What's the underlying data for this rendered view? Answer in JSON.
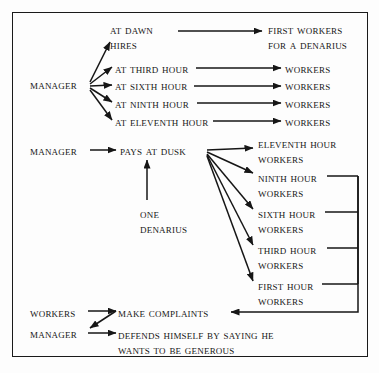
{
  "diagram": {
    "border_color": "#1a1a1a",
    "text_color": "#161616",
    "background": "#fdfdfd",
    "nodes": [
      {
        "id": "at-dawn-hires",
        "line1": "At Dawn",
        "line2": "Hires",
        "x": 110,
        "y": 22
      },
      {
        "id": "first-workers",
        "line1": "First Workers",
        "line2": "For a Denarius",
        "x": 268,
        "y": 22
      },
      {
        "id": "manager-hires",
        "line1": "Manager",
        "line2": "",
        "x": 30,
        "y": 78
      },
      {
        "id": "at-third-hour",
        "line1": "At Third Hour",
        "line2": "",
        "x": 115,
        "y": 62
      },
      {
        "id": "at-sixth-hour",
        "line1": "At Sixth Hour",
        "line2": "",
        "x": 115,
        "y": 79
      },
      {
        "id": "at-ninth-hour",
        "line1": "At Ninth Hour",
        "line2": "",
        "x": 115,
        "y": 97
      },
      {
        "id": "at-eleventh-hour",
        "line1": "At Eleventh Hour",
        "line2": "",
        "x": 115,
        "y": 115
      },
      {
        "id": "workers-third",
        "line1": "Workers",
        "line2": "",
        "x": 285,
        "y": 62
      },
      {
        "id": "workers-sixth",
        "line1": "Workers",
        "line2": "",
        "x": 285,
        "y": 79
      },
      {
        "id": "workers-ninth",
        "line1": "Workers",
        "line2": "",
        "x": 285,
        "y": 97
      },
      {
        "id": "workers-eleventh",
        "line1": "Workers",
        "line2": "",
        "x": 285,
        "y": 115
      },
      {
        "id": "manager-pays",
        "line1": "Manager",
        "line2": "",
        "x": 30,
        "y": 144
      },
      {
        "id": "pays-at-dusk",
        "line1": "Pays At Dusk",
        "line2": "",
        "x": 120,
        "y": 144
      },
      {
        "id": "one-denarius",
        "line1": "One",
        "line2": "Denarius",
        "x": 140,
        "y": 206
      },
      {
        "id": "eleventh-hour-workers",
        "line1": "Eleventh Hour",
        "line2": "Workers",
        "x": 258,
        "y": 136
      },
      {
        "id": "ninth-hour-workers",
        "line1": "Ninth Hour",
        "line2": "Workers",
        "x": 258,
        "y": 170
      },
      {
        "id": "sixth-hour-workers",
        "line1": "Sixth Hour",
        "line2": "Workers",
        "x": 258,
        "y": 206
      },
      {
        "id": "third-hour-workers",
        "line1": "Third Hour",
        "line2": "Workers",
        "x": 258,
        "y": 242
      },
      {
        "id": "first-hour-workers",
        "line1": "First Hour",
        "line2": "Workers",
        "x": 258,
        "y": 278
      },
      {
        "id": "workers-complain",
        "line1": "Workers",
        "line2": "",
        "x": 30,
        "y": 306
      },
      {
        "id": "make-complaints",
        "line1": "Make complaints",
        "line2": "",
        "x": 118,
        "y": 306
      },
      {
        "id": "manager-defends",
        "line1": "Manager",
        "line2": "",
        "x": 30,
        "y": 327
      },
      {
        "id": "defends-himself",
        "line1": "Defends Himself By Saying He",
        "line2": "Wants To Be Generous",
        "x": 118,
        "y": 327
      }
    ],
    "edges": [
      {
        "id": "edge-dawn-to-first-workers",
        "from": "at-dawn-hires",
        "to": "first-workers"
      },
      {
        "id": "edge-manager-to-dawn",
        "from": "manager-hires",
        "to": "at-dawn-hires"
      },
      {
        "id": "edge-manager-to-third",
        "from": "manager-hires",
        "to": "at-third-hour"
      },
      {
        "id": "edge-manager-to-sixth",
        "from": "manager-hires",
        "to": "at-sixth-hour"
      },
      {
        "id": "edge-manager-to-ninth",
        "from": "manager-hires",
        "to": "at-ninth-hour"
      },
      {
        "id": "edge-manager-to-eleventh",
        "from": "manager-hires",
        "to": "at-eleventh-hour"
      },
      {
        "id": "edge-third-to-workers",
        "from": "at-third-hour",
        "to": "workers-third"
      },
      {
        "id": "edge-sixth-to-workers",
        "from": "at-sixth-hour",
        "to": "workers-sixth"
      },
      {
        "id": "edge-ninth-to-workers",
        "from": "at-ninth-hour",
        "to": "workers-ninth"
      },
      {
        "id": "edge-eleventh-to-workers",
        "from": "at-eleventh-hour",
        "to": "workers-eleventh"
      },
      {
        "id": "edge-manager-to-pays",
        "from": "manager-pays",
        "to": "pays-at-dusk"
      },
      {
        "id": "edge-denarius-to-pays",
        "from": "one-denarius",
        "to": "pays-at-dusk"
      },
      {
        "id": "edge-pays-to-eleventh",
        "from": "pays-at-dusk",
        "to": "eleventh-hour-workers"
      },
      {
        "id": "edge-pays-to-ninth",
        "from": "pays-at-dusk",
        "to": "ninth-hour-workers"
      },
      {
        "id": "edge-pays-to-sixth",
        "from": "pays-at-dusk",
        "to": "sixth-hour-workers"
      },
      {
        "id": "edge-pays-to-third",
        "from": "pays-at-dusk",
        "to": "third-hour-workers"
      },
      {
        "id": "edge-pays-to-first",
        "from": "pays-at-dusk",
        "to": "first-hour-workers"
      },
      {
        "id": "edge-bracket-to-complaints",
        "from": "hour-workers-bracket",
        "to": "make-complaints"
      },
      {
        "id": "edge-workers-to-complaints",
        "from": "workers-complain",
        "to": "make-complaints"
      },
      {
        "id": "edge-complaints-to-manager",
        "from": "make-complaints",
        "to": "manager-defends"
      },
      {
        "id": "edge-manager-to-defends",
        "from": "manager-defends",
        "to": "defends-himself"
      }
    ]
  }
}
